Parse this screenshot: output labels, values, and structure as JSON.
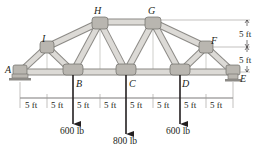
{
  "figure": {
    "type": "truss",
    "joints": {
      "A": {
        "label": "A",
        "x": 20,
        "y": 72
      },
      "B": {
        "label": "B",
        "x": 73,
        "y": 72
      },
      "C": {
        "label": "C",
        "x": 126,
        "y": 72
      },
      "D": {
        "label": "D",
        "x": 180,
        "y": 72
      },
      "E": {
        "label": "E",
        "x": 233,
        "y": 72
      },
      "F": {
        "label": "F",
        "x": 206,
        "y": 47
      },
      "G": {
        "label": "G",
        "x": 153,
        "y": 22
      },
      "H": {
        "label": "H",
        "x": 100,
        "y": 22
      },
      "I": {
        "label": "I",
        "x": 47,
        "y": 47
      }
    },
    "members": [
      [
        "A",
        "B"
      ],
      [
        "B",
        "C"
      ],
      [
        "C",
        "D"
      ],
      [
        "D",
        "E"
      ],
      [
        "A",
        "I"
      ],
      [
        "I",
        "H"
      ],
      [
        "H",
        "G"
      ],
      [
        "G",
        "F"
      ],
      [
        "F",
        "E"
      ],
      [
        "I",
        "B"
      ],
      [
        "B",
        "H"
      ],
      [
        "H",
        "C"
      ],
      [
        "C",
        "G"
      ],
      [
        "G",
        "D"
      ],
      [
        "D",
        "F"
      ]
    ],
    "horizontal_dimensions": [
      "5 ft",
      "5 ft",
      "5 ft",
      "5 ft",
      "5 ft",
      "5 ft",
      "5 ft",
      "5 ft"
    ],
    "vertical_dimensions": [
      "5 ft",
      "5 ft"
    ],
    "loads": [
      {
        "joint": "B",
        "label": "600 lb"
      },
      {
        "joint": "C",
        "label": "800 lb"
      },
      {
        "joint": "D",
        "label": "600 lb"
      }
    ],
    "colors": {
      "member_fill": "#d9d7d3",
      "member_edge": "#8c8a86",
      "gusset": "#b9b6b0",
      "line": "#231f20",
      "thin_line": "#9a9894"
    }
  }
}
